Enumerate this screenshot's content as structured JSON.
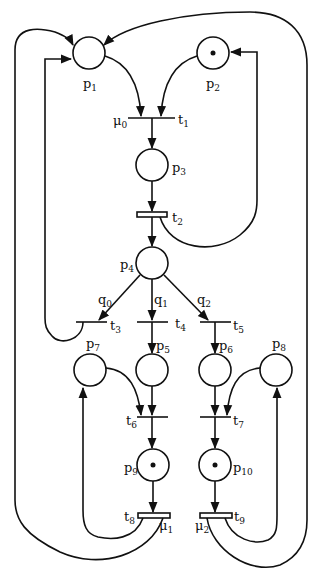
{
  "diagram": {
    "type": "petri-net",
    "places": [
      {
        "id": "p1",
        "label": "p",
        "sub": "1",
        "tokens": 0
      },
      {
        "id": "p2",
        "label": "p",
        "sub": "2",
        "tokens": 1
      },
      {
        "id": "p3",
        "label": "p",
        "sub": "3",
        "tokens": 0
      },
      {
        "id": "p4",
        "label": "p",
        "sub": "4",
        "tokens": 0
      },
      {
        "id": "p5",
        "label": "p",
        "sub": "5",
        "tokens": 0
      },
      {
        "id": "p6",
        "label": "p",
        "sub": "6",
        "tokens": 0
      },
      {
        "id": "p7",
        "label": "p",
        "sub": "7",
        "tokens": 0
      },
      {
        "id": "p8",
        "label": "p",
        "sub": "8",
        "tokens": 0
      },
      {
        "id": "p9",
        "label": "p",
        "sub": "9",
        "tokens": 1
      },
      {
        "id": "p10",
        "label": "p",
        "sub": "10",
        "tokens": 1
      }
    ],
    "transitions": [
      {
        "id": "t1",
        "label": "t",
        "sub": "1",
        "kind": "immediate",
        "rate": "μ0",
        "rate_label": "μ",
        "rate_sub": "0"
      },
      {
        "id": "t2",
        "label": "t",
        "sub": "2",
        "kind": "timed"
      },
      {
        "id": "t3",
        "label": "t",
        "sub": "3",
        "kind": "immediate",
        "prob_label": "q",
        "prob_sub": "0"
      },
      {
        "id": "t4",
        "label": "t",
        "sub": "4",
        "kind": "immediate",
        "prob_label": "q",
        "prob_sub": "1"
      },
      {
        "id": "t5",
        "label": "t",
        "sub": "5",
        "kind": "immediate",
        "prob_label": "q",
        "prob_sub": "2"
      },
      {
        "id": "t6",
        "label": "t",
        "sub": "6",
        "kind": "immediate"
      },
      {
        "id": "t7",
        "label": "t",
        "sub": "7",
        "kind": "immediate"
      },
      {
        "id": "t8",
        "label": "t",
        "sub": "8",
        "kind": "timed",
        "rate_label": "μ",
        "rate_sub": "1"
      },
      {
        "id": "t9",
        "label": "t",
        "sub": "9",
        "kind": "timed",
        "rate_label": "μ",
        "rate_sub": "2"
      }
    ],
    "arcs": [
      [
        "p1",
        "t1"
      ],
      [
        "p2",
        "t1"
      ],
      [
        "t1",
        "p3"
      ],
      [
        "p3",
        "t2"
      ],
      [
        "t2",
        "p4"
      ],
      [
        "t2",
        "p2"
      ],
      [
        "p4",
        "t3"
      ],
      [
        "p4",
        "t4"
      ],
      [
        "p4",
        "t5"
      ],
      [
        "t3",
        "p1"
      ],
      [
        "t4",
        "p5"
      ],
      [
        "t5",
        "p6"
      ],
      [
        "p7",
        "t6"
      ],
      [
        "p5",
        "t6"
      ],
      [
        "p6",
        "t7"
      ],
      [
        "p8",
        "t7"
      ],
      [
        "t6",
        "p9"
      ],
      [
        "t7",
        "p10"
      ],
      [
        "p9",
        "t8"
      ],
      [
        "p10",
        "t9"
      ],
      [
        "t8",
        "p7"
      ],
      [
        "t8",
        "p1"
      ],
      [
        "t9",
        "p8"
      ],
      [
        "t9",
        "p1"
      ]
    ]
  }
}
